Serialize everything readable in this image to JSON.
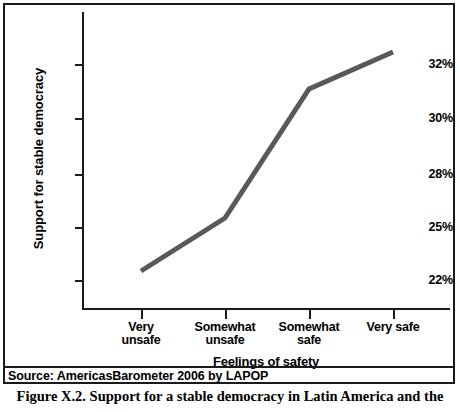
{
  "figure": {
    "source_note": "Source: AmericasBarometer 2006 by LAPOP",
    "caption": "Figure X.2.  Support for a stable democracy in Latin America and the"
  },
  "chart_data": {
    "type": "line",
    "title": "",
    "xlabel": "Feelings of safety",
    "ylabel": "Support for stable democracy",
    "categories": [
      "Very unsafe",
      "Somewhat unsafe",
      "Somewhat safe",
      "Very safe"
    ],
    "category_lines": [
      [
        "Very",
        "unsafe"
      ],
      [
        "Somewhat",
        "unsafe"
      ],
      [
        "Somewhat",
        "safe"
      ],
      [
        "Very safe"
      ]
    ],
    "values": [
      22.4,
      25.5,
      31.0,
      32.5
    ],
    "value_labels": [
      "22.4%",
      "25.5%",
      "31.0%",
      "32.5%"
    ],
    "ytick_labels": [
      "32%",
      "30%",
      "28%",
      "25%",
      "22%"
    ],
    "ytick_values": [
      32,
      30,
      28,
      25,
      22
    ],
    "ytick_pixel_y": [
      59,
      113,
      169,
      222,
      275
    ],
    "series_pixel_points": [
      {
        "x": 136,
        "y": 266
      },
      {
        "x": 220,
        "y": 213
      },
      {
        "x": 304,
        "y": 84
      },
      {
        "x": 388,
        "y": 47
      }
    ],
    "xtick_pixel_x": [
      136,
      220,
      304,
      388
    ],
    "grid": false,
    "legend": "none",
    "line_color": "#595959",
    "line_width": 5,
    "axis_color": "#1a1a1a"
  }
}
